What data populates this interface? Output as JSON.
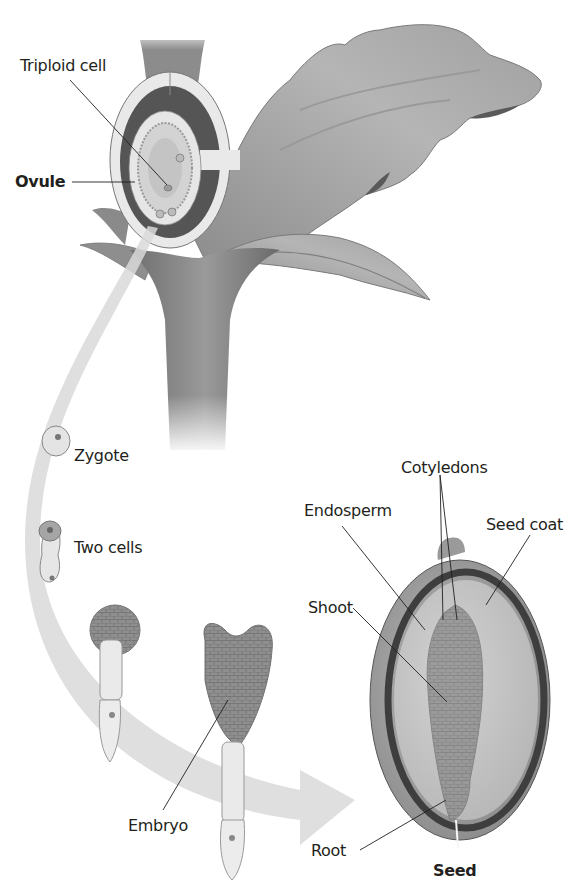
{
  "diagram": {
    "labels": {
      "triploid_cell": "Triploid cell",
      "ovule": "Ovule",
      "zygote": "Zygote",
      "two_cells": "Two cells",
      "cotyledons": "Cotyledons",
      "endosperm": "Endosperm",
      "seed_coat": "Seed coat",
      "shoot": "Shoot",
      "embryo": "Embryo",
      "root": "Root",
      "seed": "Seed"
    },
    "stages": [
      "Ovule",
      "Zygote",
      "Two cells",
      "Embryo",
      "Seed"
    ],
    "colors": {
      "background": "#ffffff",
      "text": "#231f20",
      "arrow": "#d9d9d9",
      "leaf": "#a8a8a8",
      "stem": "#8a8a8a",
      "seed_coat": "#555555",
      "endosperm": "#c8c8c8",
      "embryo": "#8e8e8e"
    }
  }
}
